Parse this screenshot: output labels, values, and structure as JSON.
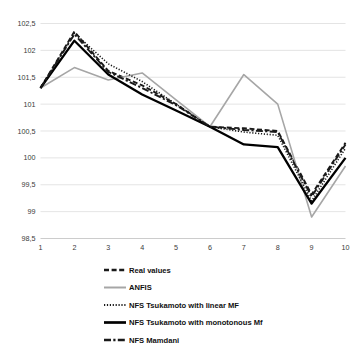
{
  "chart_data": {
    "type": "line",
    "title": "",
    "xlabel": "",
    "ylabel": "",
    "x": [
      1,
      2,
      3,
      4,
      5,
      6,
      7,
      8,
      9,
      10
    ],
    "xtick_labels": [
      "1",
      "2",
      "3",
      "4",
      "5",
      "6",
      "7",
      "8",
      "9",
      "10"
    ],
    "ytick_labels": [
      "102,5",
      "102",
      "101,5",
      "101",
      "100,5",
      "100",
      "99,5",
      "99",
      "98,5"
    ],
    "ytick_values": [
      102.5,
      102,
      101.5,
      101,
      100.5,
      100,
      99.5,
      99,
      98.5
    ],
    "ylim": [
      98.5,
      102.5
    ],
    "xlim": [
      1,
      10
    ],
    "grid": true,
    "legend_position": "bottom",
    "series": [
      {
        "name": "Real values",
        "style": "dashed",
        "color": "#1a1a1a",
        "values": [
          101.3,
          102.35,
          101.62,
          101.35,
          101.0,
          100.58,
          100.55,
          100.5,
          99.32,
          100.28
        ]
      },
      {
        "name": "ANFIS",
        "style": "solid",
        "color": "#a6a6a6",
        "values": [
          101.3,
          101.68,
          101.45,
          101.58,
          101.08,
          100.58,
          101.55,
          101.0,
          98.9,
          99.85
        ]
      },
      {
        "name": "NFS Tsukamoto with linear MF",
        "style": "dotted",
        "color": "#1a1a1a",
        "values": [
          101.3,
          102.32,
          101.75,
          101.42,
          101.0,
          100.58,
          100.48,
          100.42,
          99.2,
          100.18
        ]
      },
      {
        "name": "NFS Tsukamoto with monotonous Mf",
        "style": "solid",
        "color": "#000000",
        "values": [
          101.3,
          102.18,
          101.55,
          101.18,
          100.88,
          100.58,
          100.25,
          100.2,
          99.15,
          100.0
        ]
      },
      {
        "name": "NFS Mamdani",
        "style": "dashdot",
        "color": "#1a1a1a",
        "values": [
          101.3,
          102.3,
          101.6,
          101.3,
          100.98,
          100.58,
          100.52,
          100.48,
          99.28,
          100.25
        ]
      }
    ]
  },
  "legend": {
    "items": [
      {
        "label": "Real values",
        "swatch": "dashed-line-swatch"
      },
      {
        "label": "ANFIS",
        "swatch": "solid-gray-line-swatch"
      },
      {
        "label": "NFS Tsukamoto with linear MF",
        "swatch": "dotted-line-swatch"
      },
      {
        "label": "NFS Tsukamoto with monotonous Mf",
        "swatch": "solid-black-line-swatch"
      },
      {
        "label": "NFS Mamdani",
        "swatch": "dashdot-line-swatch"
      }
    ]
  }
}
